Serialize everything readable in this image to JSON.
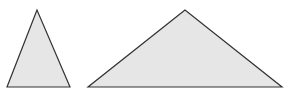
{
  "canvas": {
    "width": 287,
    "height": 96,
    "background": "#ffffff"
  },
  "style": {
    "fill": "#e6e6e6",
    "stroke": "#333333",
    "stroke_width": 1.2
  },
  "shapes": [
    {
      "name": "narrow-tall-triangle",
      "points": "37,10 7,87 70,87"
    },
    {
      "name": "wide-obtuse-triangle",
      "points": "185,10 88,87 282,87"
    }
  ]
}
